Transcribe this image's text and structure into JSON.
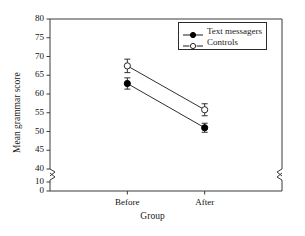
{
  "chart_data": {
    "type": "line",
    "title": "",
    "xlabel": "Group",
    "ylabel": "Mean grammar score",
    "categories": [
      "Before",
      "After"
    ],
    "ylim": [
      40,
      80
    ],
    "yticks": [
      40,
      45,
      50,
      55,
      60,
      65,
      70,
      75,
      80
    ],
    "yticks_below_break": [
      0,
      10
    ],
    "axis_break": true,
    "axis_break_between": [
      10,
      40
    ],
    "grid": false,
    "legend_position": "top-right",
    "series": [
      {
        "name": "Text messagers",
        "marker": "filled-circle",
        "line": "solid",
        "values": [
          62.8,
          51.0
        ],
        "errors": [
          1.5,
          1.2
        ]
      },
      {
        "name": "Controls",
        "marker": "open-circle",
        "line": "solid",
        "values": [
          67.5,
          55.8
        ],
        "errors": [
          1.8,
          1.6
        ]
      }
    ]
  },
  "colors": {
    "axis": "#3a3a3a",
    "series_filled": "#000000",
    "series_open_fill": "#ffffff",
    "series_open_stroke": "#2a2a2a",
    "background": "#ffffff"
  }
}
